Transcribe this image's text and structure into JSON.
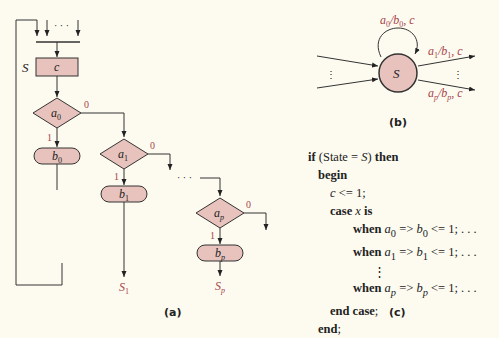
{
  "colors": {
    "node_fill": "#e8c3bd",
    "node_stroke": "#333333",
    "label_red": "#a8434a",
    "background": "#fdfbf0"
  },
  "panel_a": {
    "caption": "(a)",
    "state_label": "S",
    "state_box": "c",
    "entry_dots": "· · ·",
    "mid_dots": "· · ·",
    "decisions": [
      {
        "cond": "a",
        "sub": "0",
        "true_label": "1",
        "false_label": "0",
        "action": "b",
        "action_sub": "0"
      },
      {
        "cond": "a",
        "sub": "1",
        "true_label": "1",
        "false_label": "0",
        "action": "b",
        "action_sub": "1",
        "next": "S",
        "next_sub": "1"
      },
      {
        "cond": "a",
        "sub": "p",
        "true_label": "1",
        "false_label": "0",
        "action": "b",
        "action_sub": "p",
        "next": "S",
        "next_sub": "p"
      }
    ]
  },
  "panel_b": {
    "caption": "(b)",
    "state": "S",
    "self_loop": {
      "a": "a",
      "a_sub": "0",
      "b": "b",
      "b_sub": "0",
      "c": "c"
    },
    "out_edges": [
      {
        "a": "a",
        "a_sub": "1",
        "b": "b",
        "b_sub": "1",
        "c": "c"
      },
      {
        "a": "a",
        "a_sub": "p",
        "b": "b",
        "b_sub": "p",
        "c": "c"
      }
    ]
  },
  "panel_c": {
    "caption": "(c)",
    "lines": {
      "l1_kw1": "if",
      "l1_text": " (State = ",
      "l1_var": "S",
      "l1_close": ") ",
      "l1_kw2": "then",
      "l2_kw": "begin",
      "l3_var": "c",
      "l3_text": " <= 1;",
      "l4_kw1": "case",
      "l4_var": " x ",
      "l4_kw2": "is",
      "when_kw": "when",
      "w0_a": "a",
      "w0_as": "0",
      "w0_b": "b",
      "w0_bs": "0",
      "w_rest": " <= 1;  . . .",
      "w1_a": "a",
      "w1_as": "1",
      "w1_b": "b",
      "w1_bs": "1",
      "wp_a": "a",
      "wp_as": "p",
      "wp_b": "b",
      "wp_bs": "p",
      "arrow": " => ",
      "vdots": "⋮",
      "l_end_case": "end case",
      "semicolon": ";",
      "l_end": "end"
    }
  }
}
